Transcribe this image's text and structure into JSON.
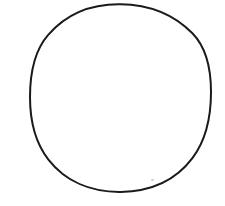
{
  "canvas": {
    "width": 225,
    "height": 206,
    "background_color": "#ffffff",
    "description": "blank white canvas containing a single hand-drawn circle outline"
  },
  "figure": {
    "name": "circle",
    "type": "ellipse-outline",
    "filled": false,
    "fill_color": "none",
    "stroke_color": "#1a1a1a",
    "stroke_width": 2,
    "center_x": 120.5,
    "center_y": 98,
    "radius_x": 90.5,
    "radius_y": 94,
    "bounds": {
      "left": 30,
      "top": 4,
      "right": 211,
      "bottom": 192
    },
    "label": ""
  },
  "artifacts": [
    {
      "name": "speck",
      "x": 151,
      "y": 179,
      "width": 3,
      "height": 2,
      "color": "#c9c9c9"
    }
  ],
  "text_content": []
}
